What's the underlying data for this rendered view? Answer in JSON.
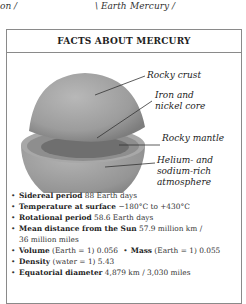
{
  "top_caption": {
    "left_fragment": "on /",
    "earth": "\\ Earth",
    "mercury": "Mercury /"
  },
  "box": {
    "title": "FACTS ABOUT MERCURY",
    "labels": [
      {
        "id": "crust",
        "text": "Rocky crust"
      },
      {
        "id": "core_line1",
        "text": "Iron and"
      },
      {
        "id": "core_line2",
        "text": "nickel core"
      },
      {
        "id": "mantle",
        "text": "Rocky mantle"
      },
      {
        "id": "atm_line1",
        "text": "Helium- and"
      },
      {
        "id": "atm_line2",
        "text": "sodium-rich"
      },
      {
        "id": "atm_line3",
        "text": "atmosphere"
      }
    ],
    "facts": [
      {
        "label": "Sidereal period",
        "value": " 88 Earth days"
      },
      {
        "label": "Temperature at surface",
        "value": "  −180°C to +430°C"
      },
      {
        "label": "Rotational period",
        "value": " 58.6 Earth days"
      },
      {
        "label": "Mean distance from the Sun",
        "value": " 57.9 million km /",
        "continuation": "36 million miles"
      },
      {
        "label": "Volume",
        "note": " (Earth = 1)",
        "value": " 0.056",
        "label2": "Mass",
        "note2": " (Earth = 1)",
        "value2": " 0.055"
      },
      {
        "label": "Density",
        "note": " (water = 1)",
        "value": " 5.43"
      },
      {
        "label": "Equatorial diameter",
        "value": " 4,879 km / 3,030 miles"
      }
    ],
    "bullet": "•"
  },
  "colors": {
    "border": "#8a8a8a",
    "planet_surface": "#9a9a9a",
    "planet_core": "#6f6f6f"
  }
}
